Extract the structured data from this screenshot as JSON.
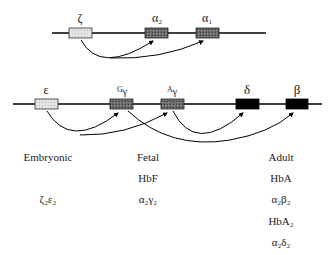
{
  "alpha_cluster": {
    "genes": [
      {
        "id": "zeta",
        "label": "ζ",
        "type": "embryonic"
      },
      {
        "id": "alpha2",
        "label": "α",
        "sub": "2",
        "type": "fetal-adult"
      },
      {
        "id": "alpha1",
        "label": "α",
        "sub": "1",
        "type": "fetal-adult"
      }
    ]
  },
  "beta_cluster": {
    "genes": [
      {
        "id": "epsilon",
        "label": "ε",
        "type": "embryonic"
      },
      {
        "id": "G-gamma",
        "pre": "G",
        "label": "γ",
        "type": "fetal"
      },
      {
        "id": "A-gamma",
        "pre": "A",
        "label": "γ",
        "type": "fetal"
      },
      {
        "id": "delta",
        "label": "δ",
        "type": "adult"
      },
      {
        "id": "beta",
        "label": "β",
        "type": "adult"
      }
    ]
  },
  "stages": {
    "embryonic": {
      "title": "Embryonic",
      "rows": [
        "ζ₂ε₂"
      ]
    },
    "fetal": {
      "title": "Fetal",
      "rows": [
        "HbF",
        "α₂γ₂"
      ]
    },
    "adult": {
      "title": "Adult",
      "rows": [
        "HbA",
        "α₂β₂",
        "HbA₂",
        "α₂δ₂"
      ]
    }
  },
  "colors": {
    "embryonic_box": "#d8d8d8",
    "fetal_box": "#7a7a7a",
    "adult_box": "#000000",
    "line": "#000000"
  }
}
